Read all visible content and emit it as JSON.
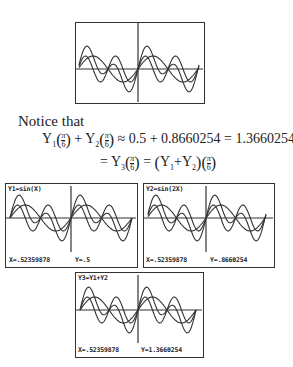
{
  "top_graph": {
    "description": "three sine curves y1, y2, y3 overlaid"
  },
  "notice_text": "Notice that",
  "equation": {
    "line1_left": "Y",
    "sub1": "1",
    "sub2": "2",
    "frac_num": "π",
    "frac_den": "6",
    "approx": "≈",
    "plus": "+",
    "value_y1": "0.5",
    "value_y2": "0.8660254",
    "value_sum": "1.3660254",
    "line2_y3": "Y",
    "sub3": "3",
    "line2_sum": "Y",
    "equals": "="
  },
  "screens": [
    {
      "func_label": "Y1=sin(X)",
      "x_readout": "X=.52359878",
      "y_readout": "Y=.5"
    },
    {
      "func_label": "Y2=sin(2X)",
      "x_readout": "X=.52359878",
      "y_readout": "Y=.8660254"
    },
    {
      "func_label": "Y3=Y1+Y2",
      "x_readout": "X=.52359878",
      "y_readout": "Y=1.3660254"
    }
  ]
}
